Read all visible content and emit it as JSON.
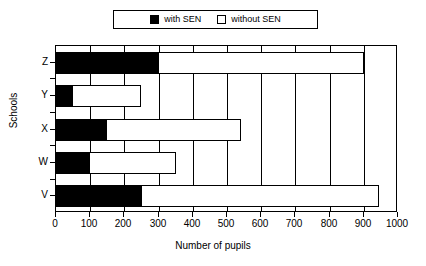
{
  "chart_data": {
    "type": "bar",
    "orientation": "horizontal",
    "stacked": true,
    "title": "",
    "xlabel": "Number of pupils",
    "ylabel": "Schools",
    "categories": [
      "V",
      "W",
      "X",
      "Y",
      "Z"
    ],
    "category_order_top_to_bottom": [
      "Z",
      "Y",
      "X",
      "W",
      "V"
    ],
    "series": [
      {
        "name": "with SEN",
        "color": "#000000",
        "values": [
          250,
          100,
          150,
          50,
          300
        ]
      },
      {
        "name": "without SEN",
        "color": "#ffffff",
        "values": [
          695,
          250,
          390,
          200,
          600
        ]
      }
    ],
    "totals": [
      945,
      350,
      540,
      250,
      900
    ],
    "xlim": [
      0,
      1000
    ],
    "xticks": [
      0,
      100,
      200,
      300,
      400,
      500,
      600,
      700,
      800,
      900,
      1000
    ],
    "xtick_labels": [
      "0",
      "100",
      "200",
      "300",
      "400",
      "500",
      "600",
      "700",
      "800",
      "900",
      "1000"
    ],
    "grid": "vertical",
    "legend_position": "top-center"
  },
  "legend": {
    "entries": [
      {
        "label": "with SEN",
        "swatch": "filled-square-icon"
      },
      {
        "label": "without SEN",
        "swatch": "hollow-square-icon"
      }
    ]
  },
  "axes": {
    "x_title": "Number of pupils",
    "y_title": "Schools"
  }
}
